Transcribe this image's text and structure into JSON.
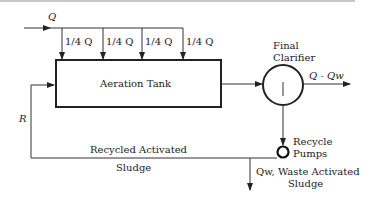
{
  "diagram": {
    "influent_label": "Q",
    "step_feed_labels": [
      "1/4 Q",
      "1/4 Q",
      "1/4 Q",
      "1/4 Q"
    ],
    "aeration_tank_label": "Aeration Tank",
    "clarifier_label_line1": "Final",
    "clarifier_label_line2": "Clarifier",
    "effluent_label": "Q - Qw",
    "recycle_label": "R",
    "recycle_sludge_line1": "Recycled Activated",
    "recycle_sludge_line2": "Sludge",
    "pump_label_line1": "Recycle",
    "pump_label_line2": "Pumps",
    "waste_label_line1": "Qw, Waste Activated",
    "waste_label_line2": "Sludge"
  }
}
